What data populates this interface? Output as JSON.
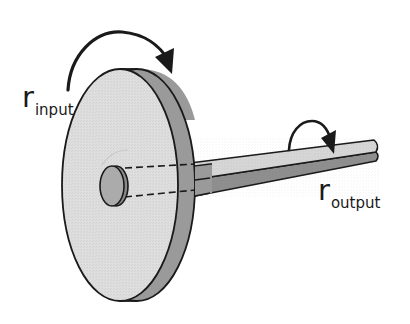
{
  "diagram": {
    "colors": {
      "background": "#ffffff",
      "face_fill": "#dcdcdc",
      "rim_fill": "#9a9a9a",
      "shaft_top": "#d4d4d4",
      "shaft_bottom": "#8f8f8f",
      "hub_fill": "#a8a8a8",
      "outline": "#1a1a1a"
    },
    "labels": {
      "input": {
        "main": "r",
        "sub": "input"
      },
      "output": {
        "main": "r",
        "sub": "output"
      }
    },
    "components": [
      {
        "id": "wheel",
        "description": "large disc (input wheel)"
      },
      {
        "id": "hub",
        "description": "hub at wheel center"
      },
      {
        "id": "axle",
        "description": "long thin shaft (output axle)"
      },
      {
        "id": "input-rotation-arrow",
        "description": "curved arrow over wheel, clockwise"
      },
      {
        "id": "output-rotation-arrow",
        "description": "curved arrow over axle, clockwise"
      },
      {
        "id": "hidden-axle-lines",
        "description": "dashed lines showing axle passing through wheel"
      }
    ]
  }
}
